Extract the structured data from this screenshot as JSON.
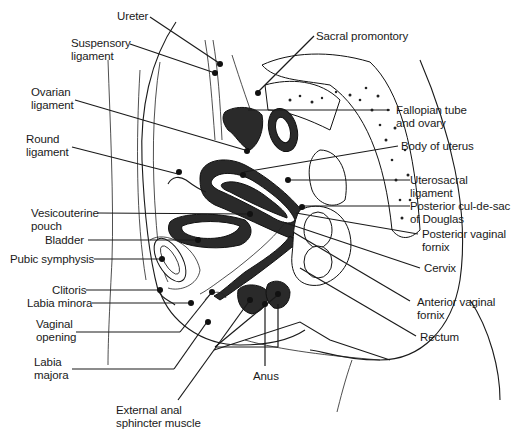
{
  "figure": {
    "type": "anatomical line drawing"
  },
  "labels_left": [
    {
      "id": "ureter",
      "text": "Ureter"
    },
    {
      "id": "suspensory-ligament",
      "text": "Suspensory\nligament"
    },
    {
      "id": "ovarian-ligament",
      "text": "Ovarian\nligament"
    },
    {
      "id": "round-ligament",
      "text": "Round\nligament"
    },
    {
      "id": "vesicouterine-pouch",
      "text": "Vesicouterine\npouch"
    },
    {
      "id": "bladder",
      "text": "Bladder"
    },
    {
      "id": "pubic-symphysis",
      "text": "Pubic symphysis"
    },
    {
      "id": "clitoris",
      "text": "Clitoris"
    },
    {
      "id": "labia-minora",
      "text": "Labia minora"
    },
    {
      "id": "vaginal-opening",
      "text": "Vaginal\nopening"
    },
    {
      "id": "labia-majora",
      "text": "Labia\nmajora"
    }
  ],
  "labels_right": [
    {
      "id": "sacral-promontory",
      "text": "Sacral promontory"
    },
    {
      "id": "fallopian-tube-ovary",
      "text": "Fallopian tube\nand ovary"
    },
    {
      "id": "body-of-uterus",
      "text": "Body of uterus"
    },
    {
      "id": "uterosacral-ligament",
      "text": "Uterosacral\nligament"
    },
    {
      "id": "posterior-cul-de-sac",
      "text": "Posterior cul-de-sac\nof Douglas"
    },
    {
      "id": "posterior-vaginal-fornix",
      "text": "Posterior vaginal\nfornix"
    },
    {
      "id": "cervix",
      "text": "Cervix"
    },
    {
      "id": "anterior-vaginal-fornix",
      "text": "Anterior vaginal\nfornix"
    },
    {
      "id": "rectum",
      "text": "Rectum"
    }
  ],
  "labels_bottom": [
    {
      "id": "anus",
      "text": "Anus"
    },
    {
      "id": "external-anal-sphincter",
      "text": "External anal\nsphincter muscle"
    }
  ],
  "colors": {
    "ink": "#1a1a1a",
    "background": "#ffffff"
  }
}
